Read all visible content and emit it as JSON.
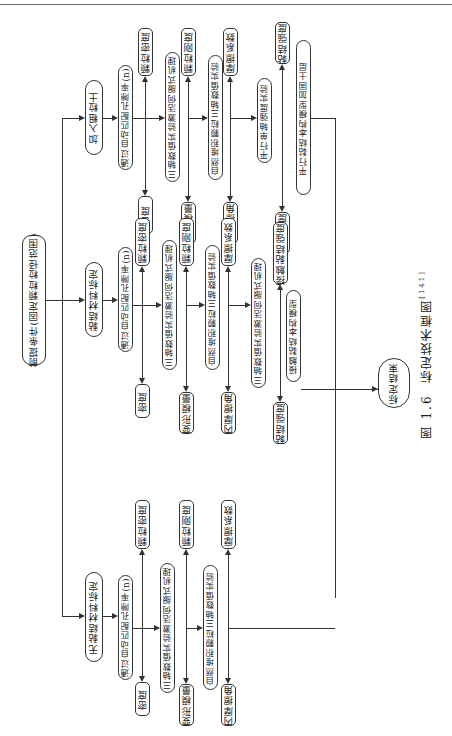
{
  "caption": {
    "figure_no": "图 1.6",
    "title": "标定技术框图",
    "ref": "[141]"
  },
  "root": "前提条件(固定颗粒粒径范围)",
  "branches": [
    {
      "id": "no-binder",
      "title": "无黏结材料标定",
      "step": "通过自动匹配孔隙率(n)",
      "row1": {
        "left": "密度",
        "right": "颗粒密度",
        "test": "三轴数值实验激活伺服式机理"
      },
      "row2": {
        "left": "变形模量",
        "right": "颗粒刚度",
        "test": "自然堆积颗粒三轴数值实验"
      },
      "row3": {
        "left": "内摩擦角",
        "right": "摩擦系数"
      }
    },
    {
      "id": "binder",
      "title": "黏结材料标定",
      "step": "通过自动匹配孔隙率(n)",
      "row1": {
        "left": "密度",
        "right": "颗粒密度",
        "test": "三轴数值实验激活伺服式机理"
      },
      "row2": {
        "left": "变形模量",
        "right": "颗粒刚度",
        "test": "自然堆积颗粒三轴数值实验"
      },
      "row3": {
        "left": "内摩擦角",
        "right": "摩擦系数",
        "test": "三轴数值实验激活伺服式机理"
      },
      "row4": {
        "left": "黏结强度",
        "right": "接触黏结强度",
        "test": "接触黏结本构模型"
      }
    },
    {
      "id": "coarse",
      "title": "加入粗粒土",
      "step": "通过自动匹配孔隙率(n)",
      "row1": {
        "left": "密度",
        "right": "颗粒密度",
        "test": "三轴数值实验激活伺服式机理"
      },
      "row2": {
        "left": "变形模量",
        "right": "颗粒刚度",
        "test": "自然堆积颗粒三轴数值实验"
      },
      "row3": {
        "left": "内摩擦角",
        "right": "摩擦系数",
        "test": "平行单轴强度实验"
      },
      "row4": {
        "left": "峰值强度",
        "right": "黏结强度",
        "test": "平行黏结本构模型加固土层"
      }
    }
  ],
  "end": "标定结束"
}
